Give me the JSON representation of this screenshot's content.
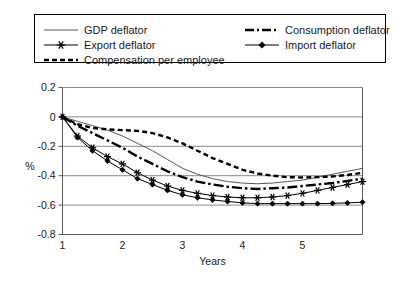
{
  "chart_data": {
    "type": "line",
    "title": "",
    "xlabel": "Years",
    "ylabel": "%",
    "xlim": [
      1,
      6
    ],
    "ylim": [
      -0.8,
      0.2
    ],
    "xticks": [
      "1",
      "2",
      "3",
      "4",
      "5"
    ],
    "xtick_values": [
      1,
      2,
      3,
      4,
      5
    ],
    "yticks": [
      "0.2",
      "0",
      "-0.2",
      "-0.4",
      "-0.6",
      "-0.8"
    ],
    "ytick_values": [
      0.2,
      0,
      -0.2,
      -0.4,
      -0.6,
      -0.8
    ],
    "grid": "horizontal",
    "legend_position": "top",
    "x": [
      1.0,
      1.25,
      1.5,
      1.75,
      2.0,
      2.25,
      2.5,
      2.75,
      3.0,
      3.25,
      3.5,
      3.75,
      4.0,
      4.25,
      4.5,
      4.75,
      5.0,
      5.25,
      5.5,
      5.75,
      6.0
    ],
    "series": [
      {
        "name": "GDP deflator",
        "style": "solid-thin",
        "color": "#555555",
        "marker": "none",
        "values": [
          0.0,
          -0.03,
          -0.06,
          -0.09,
          -0.13,
          -0.18,
          -0.23,
          -0.29,
          -0.35,
          -0.39,
          -0.42,
          -0.44,
          -0.45,
          -0.455,
          -0.45,
          -0.44,
          -0.43,
          -0.41,
          -0.39,
          -0.37,
          -0.35
        ]
      },
      {
        "name": "Consumption deflator",
        "style": "dash-dot",
        "color": "#000000",
        "marker": "none",
        "values": [
          0.0,
          -0.06,
          -0.11,
          -0.16,
          -0.21,
          -0.27,
          -0.32,
          -0.37,
          -0.41,
          -0.44,
          -0.46,
          -0.475,
          -0.485,
          -0.49,
          -0.485,
          -0.48,
          -0.47,
          -0.46,
          -0.45,
          -0.435,
          -0.42
        ]
      },
      {
        "name": "Export deflator",
        "style": "solid-thin",
        "color": "#000000",
        "marker": "asterisk",
        "values": [
          0.0,
          -0.13,
          -0.21,
          -0.27,
          -0.32,
          -0.38,
          -0.43,
          -0.47,
          -0.5,
          -0.52,
          -0.535,
          -0.545,
          -0.55,
          -0.55,
          -0.545,
          -0.535,
          -0.52,
          -0.5,
          -0.48,
          -0.46,
          -0.44
        ]
      },
      {
        "name": "Import deflator",
        "style": "solid-thin",
        "color": "#000000",
        "marker": "diamond",
        "values": [
          0.0,
          -0.14,
          -0.23,
          -0.3,
          -0.36,
          -0.42,
          -0.46,
          -0.5,
          -0.53,
          -0.55,
          -0.565,
          -0.575,
          -0.585,
          -0.59,
          -0.59,
          -0.59,
          -0.59,
          -0.59,
          -0.588,
          -0.585,
          -0.58
        ]
      },
      {
        "name": "Compensation per employee",
        "style": "dotted",
        "color": "#000000",
        "marker": "none",
        "values": [
          0.0,
          -0.05,
          -0.075,
          -0.085,
          -0.09,
          -0.095,
          -0.11,
          -0.14,
          -0.18,
          -0.23,
          -0.28,
          -0.32,
          -0.36,
          -0.385,
          -0.4,
          -0.41,
          -0.412,
          -0.41,
          -0.405,
          -0.395,
          -0.38
        ]
      }
    ]
  },
  "legend": {
    "items": [
      {
        "label": "GDP deflator",
        "style": "solid-thin",
        "marker": "none"
      },
      {
        "label": "Consumption deflator",
        "style": "dash-dot",
        "marker": "none"
      },
      {
        "label": "Export deflator",
        "style": "solid-thin",
        "marker": "asterisk"
      },
      {
        "label": "Import deflator",
        "style": "solid-thin",
        "marker": "diamond"
      },
      {
        "label": "Compensation per employee",
        "style": "dotted",
        "marker": "none"
      }
    ]
  }
}
